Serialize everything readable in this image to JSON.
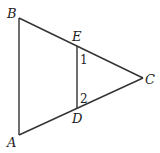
{
  "diagram": {
    "type": "geometry-triangle",
    "points": {
      "A": {
        "label": "A"
      },
      "B": {
        "label": "B"
      },
      "C": {
        "label": "C"
      },
      "D": {
        "label": "D"
      },
      "E": {
        "label": "E"
      }
    },
    "angles": {
      "angle1": {
        "label": "1"
      },
      "angle2": {
        "label": "2"
      }
    },
    "segments": [
      "AB",
      "BC",
      "AC",
      "ED"
    ],
    "stroke_color": "#333333"
  }
}
